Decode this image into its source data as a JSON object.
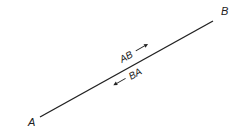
{
  "diagram": {
    "endpoints": {
      "start": {
        "label": "A"
      },
      "end": {
        "label": "B"
      }
    },
    "annotations": {
      "forward": {
        "label": "AB",
        "arrow": "right-arrow"
      },
      "backward": {
        "label": "BA",
        "arrow": "left-arrow"
      }
    },
    "colors": {
      "line": "#222222",
      "text": "#222222",
      "background": "#ffffff"
    }
  }
}
